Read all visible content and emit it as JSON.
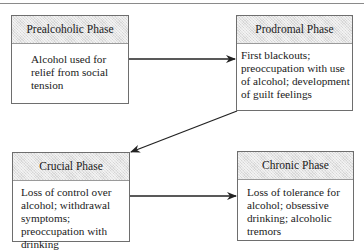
{
  "diagram": {
    "type": "flowchart",
    "phases": [
      {
        "id": "prealcoholic",
        "title": "Prealcoholic Phase",
        "description": "Alcohol used for relief from social tension"
      },
      {
        "id": "prodromal",
        "title": "Prodromal Phase",
        "description": "First blackouts; preoccupation with use of alcohol; development of guilt feelings"
      },
      {
        "id": "crucial",
        "title": "Crucial Phase",
        "description": "Loss of control over alcohol; withdrawal symptoms; preoccupation with drinking"
      },
      {
        "id": "chronic",
        "title": "Chronic Phase",
        "description": "Loss of tolerance for alcohol; obsessive drinking; alcoholic tremors"
      }
    ],
    "edges": [
      {
        "from": "prealcoholic",
        "to": "prodromal"
      },
      {
        "from": "prodromal",
        "to": "crucial"
      },
      {
        "from": "crucial",
        "to": "chronic"
      }
    ],
    "colors": {
      "header_fill": "#d6d6d6",
      "border": "#6e6e6e",
      "arrow": "#222222"
    }
  }
}
